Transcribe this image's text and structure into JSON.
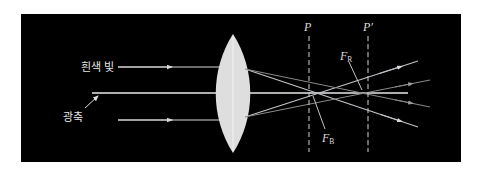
{
  "diagram": {
    "type": "chromatic-aberration-convex-lens",
    "background_color": "#000000",
    "labels": {
      "incident_light": "흰색 빛",
      "optical_axis": "광축",
      "plane_p": "P",
      "plane_p_prime": "P′",
      "focus_red_main": "F",
      "focus_red_sub": "R",
      "focus_blue_main": "F",
      "focus_blue_sub": "B"
    },
    "colors": {
      "lens": "#dedede",
      "axis": "#e8e8e8",
      "incident_ray": "#d8d8d8",
      "blue_ray": "#bfc3c8",
      "red_ray": "#8a8a8a",
      "dashed_plane": "#d0d0d0"
    },
    "geometry": {
      "lens_center_x": 233,
      "axis_y": 93,
      "top_ray_y": 67,
      "bottom_ray_y": 120,
      "blue_focus_x": 309,
      "red_focus_x": 368
    }
  }
}
